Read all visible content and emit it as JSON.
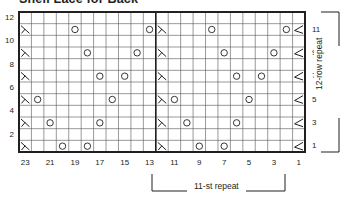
{
  "title": "Shell Lace for Back",
  "chart_data": {
    "type": "table",
    "columns": 23,
    "rows": 12,
    "stitch_numbers": [
      23,
      22,
      21,
      20,
      19,
      18,
      17,
      16,
      15,
      14,
      13,
      12,
      11,
      10,
      9,
      8,
      7,
      6,
      5,
      4,
      3,
      2,
      1
    ],
    "row_labels_left": [
      "12",
      "10",
      "8",
      "6",
      "4",
      "2"
    ],
    "row_labels_right": [
      "11",
      "9",
      "7",
      "5",
      "3",
      "1"
    ],
    "col_labels": [
      "23",
      "21",
      "19",
      "17",
      "15",
      "13",
      "11",
      "9",
      "7",
      "5",
      "3",
      "1"
    ],
    "symbols": {
      "yo": "O (yarn over)",
      "dec_left": "left-slanting decrease with stem (stitches 23 and 12)",
      "dec_right": "< right decrease (stitch 1)"
    },
    "pattern_rows": [
      {
        "row": 1,
        "yo": [
          9,
          7,
          20,
          18
        ],
        "dec_left": [
          23,
          12
        ],
        "dec_right": [
          1
        ]
      },
      {
        "row": 3,
        "yo": [
          10,
          6,
          21,
          17
        ],
        "dec_left": [
          23,
          12
        ],
        "dec_right": [
          1
        ]
      },
      {
        "row": 5,
        "yo": [
          11,
          5,
          22,
          16
        ],
        "dec_left": [
          23,
          12
        ],
        "dec_right": [
          1
        ]
      },
      {
        "row": 7,
        "yo": [
          6,
          4,
          17,
          15
        ],
        "dec_left": [
          23,
          12
        ],
        "dec_right": [
          1
        ]
      },
      {
        "row": 9,
        "yo": [
          7,
          3,
          18,
          14
        ],
        "dec_left": [
          23,
          12
        ],
        "dec_right": [
          1
        ]
      },
      {
        "row": 11,
        "yo": [
          8,
          2,
          19,
          13
        ],
        "dec_left": [
          23,
          12
        ],
        "dec_right": [
          1
        ]
      }
    ],
    "repeat_stitches": "11-st repeat (stitches 1-11)",
    "repeat_rows": "12-row repeat (rows 1-12)"
  },
  "annotations": {
    "stitch_repeat": "11-st repeat",
    "row_repeat": "12-row repeat"
  }
}
